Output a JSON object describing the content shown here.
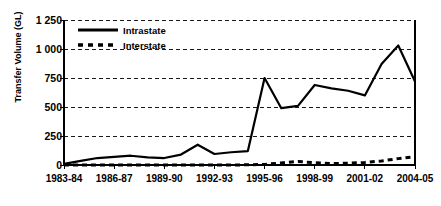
{
  "chart_data": {
    "type": "line",
    "title": "",
    "xlabel": "",
    "ylabel": "Transfer Volume (GL)",
    "ylim": [
      0,
      1250
    ],
    "yticks": [
      "0",
      "250",
      "500",
      "750",
      "1 000",
      "1 250"
    ],
    "ytick_values": [
      0,
      250,
      500,
      750,
      1000,
      1250
    ],
    "grid": true,
    "grid_axis": "y",
    "legend_position": "top-left",
    "x": [
      "1983-84",
      "1984-85",
      "1985-86",
      "1986-87",
      "1987-88",
      "1988-89",
      "1989-90",
      "1990-91",
      "1991-92",
      "1992-93",
      "1993-94",
      "1994-95",
      "1995-96",
      "1996-97",
      "1997-98",
      "1998-99",
      "1999-00",
      "2000-01",
      "2001-02",
      "2002-03",
      "2003-04",
      "2004-05"
    ],
    "xticks": [
      "1983-84",
      "1986-87",
      "1989-90",
      "1992-93",
      "1995-96",
      "1998-99",
      "2001-02",
      "2004-05"
    ],
    "xtick_indices": [
      0,
      3,
      6,
      9,
      12,
      15,
      18,
      21
    ],
    "series": [
      {
        "name": "Intrastate",
        "style": "solid",
        "color": "#000000",
        "values": [
          10,
          35,
          60,
          70,
          80,
          65,
          60,
          90,
          175,
          95,
          110,
          120,
          750,
          490,
          510,
          690,
          660,
          640,
          600,
          870,
          1030,
          720
        ]
      },
      {
        "name": "Interstate",
        "style": "dashed",
        "color": "#000000",
        "values": [
          0,
          0,
          0,
          0,
          0,
          0,
          0,
          0,
          0,
          0,
          0,
          2,
          5,
          18,
          30,
          20,
          12,
          15,
          22,
          35,
          55,
          72
        ]
      }
    ]
  },
  "legend": {
    "items": [
      {
        "label": "Intrastate",
        "style": "solid"
      },
      {
        "label": "Interstate",
        "style": "dashed"
      }
    ]
  },
  "axis": {
    "y_title": "Transfer Volume (GL)"
  }
}
